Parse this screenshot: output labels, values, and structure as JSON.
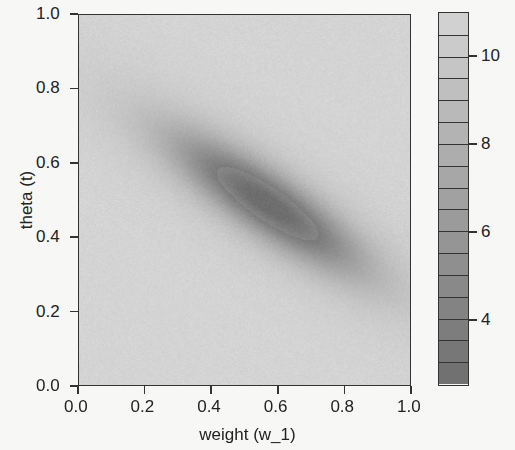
{
  "chart_data": {
    "type": "heatmap",
    "title": "",
    "xlabel": "weight (w_1)",
    "ylabel": "theta (t)",
    "xlim": [
      0.0,
      1.0
    ],
    "ylim": [
      0.0,
      1.0
    ],
    "x_ticks": [
      "0.0",
      "0.2",
      "0.4",
      "0.6",
      "0.8",
      "1.0"
    ],
    "y_ticks": [
      "0.0",
      "0.2",
      "0.4",
      "0.6",
      "0.8",
      "1.0"
    ],
    "grid": false,
    "colormap": "grayscale (dark = low, light = high)",
    "colorbar": {
      "range": [
        2.5,
        11.0
      ],
      "step": 0.5,
      "tick_labels": [
        "4",
        "6",
        "8",
        "10"
      ],
      "tick_values": [
        4,
        6,
        8,
        10
      ]
    },
    "minimum": {
      "w": 0.57,
      "t": 0.49,
      "value": 2.5
    },
    "valley_direction": "diagonal from upper-left (w≈0.1, t≈0.8) to lower-right (w≈0.9, t≈0.3)",
    "max_value_region": "corners (upper-right and lower-left) ≈ 11"
  }
}
